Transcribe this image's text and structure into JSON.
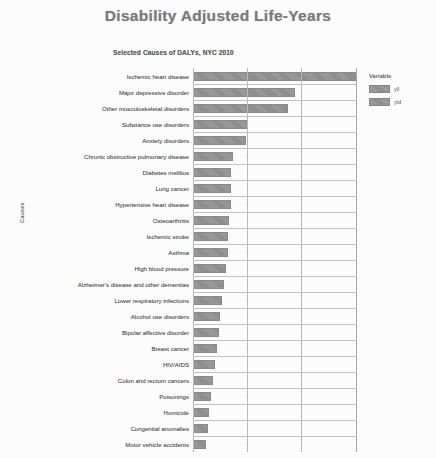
{
  "title": "Disability Adjusted Life-Years",
  "subtitle": "Selected Causes of DALYs, NYC 2010",
  "axis": {
    "y_title": "Causes"
  },
  "legend": {
    "title": "Variable",
    "items": [
      {
        "label": "yll",
        "color": "#8e8e8e"
      },
      {
        "label": "yld",
        "color": "#8e8e8e"
      }
    ]
  },
  "chart_data": {
    "type": "bar",
    "orientation": "horizontal",
    "title": "Disability Adjusted Life-Years",
    "subtitle": "Selected Causes of DALYs, NYC 2010",
    "xlabel": "",
    "ylabel": "Causes",
    "grid": true,
    "legend_position": "right",
    "xlim": [
      0,
      100
    ],
    "categories": [
      "Ischemic heart disease",
      "Major depressive disorder",
      "Other musculoskeletal disorders",
      "Substance use disorders",
      "Anxiety disorders",
      "Chronic obstructive pulmonary disease",
      "Diabetes mellitus",
      "Lung cancer",
      "Hypertensive heart disease",
      "Osteoarthritis",
      "Ischemic stroke",
      "Asthma",
      "High blood pressure",
      "Alzheimer's disease and other dementias",
      "Lower respiratory infections",
      "Alcohol use disorders",
      "Bipolar affective disorder",
      "Breast cancer",
      "HIV/AIDS",
      "Colon and rectum cancers",
      "Poisonings",
      "Homicide",
      "Congenital anomalies",
      "Motor vehicle accidents"
    ],
    "values": [
      90,
      56,
      52,
      30,
      29,
      22,
      21,
      21,
      21,
      20,
      19,
      19,
      18,
      17,
      16,
      15,
      14,
      13,
      12,
      11,
      10,
      9,
      8,
      7
    ],
    "series": [
      {
        "name": "yll",
        "values": [
          90,
          56,
          52,
          30,
          29,
          22,
          21,
          21,
          21,
          20,
          19,
          19,
          18,
          17,
          16,
          15,
          14,
          13,
          12,
          11,
          10,
          9,
          8,
          7
        ]
      }
    ]
  }
}
